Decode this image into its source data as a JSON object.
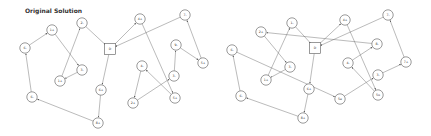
{
  "title": "Original Solution",
  "graphs": [
    {
      "name": "original-solution",
      "depot": {
        "id": "D",
        "x": 110,
        "y": 49
      },
      "nodes": [
        {
          "id": "a",
          "label": "1+",
          "x": 52,
          "y": 30
        },
        {
          "id": "b",
          "label": "6-",
          "x": 25,
          "y": 48
        },
        {
          "id": "c",
          "label": "2-",
          "x": 82,
          "y": 23
        },
        {
          "id": "d",
          "label": "3-",
          "x": 82,
          "y": 70
        },
        {
          "id": "e",
          "label": "1+",
          "x": 60,
          "y": 81
        },
        {
          "id": "f",
          "label": "4+",
          "x": 140,
          "y": 19
        },
        {
          "id": "g",
          "label": "7-",
          "x": 185,
          "y": 15
        },
        {
          "id": "h",
          "label": "9-",
          "x": 176,
          "y": 45
        },
        {
          "id": "i",
          "label": "5+",
          "x": 203,
          "y": 63
        },
        {
          "id": "j",
          "label": "4-",
          "x": 142,
          "y": 66
        },
        {
          "id": "k",
          "label": "3-",
          "x": 174,
          "y": 76
        },
        {
          "id": "l",
          "label": "2+",
          "x": 133,
          "y": 103
        },
        {
          "id": "m",
          "label": "5+",
          "x": 175,
          "y": 98
        },
        {
          "id": "n",
          "label": "6+",
          "x": 101,
          "y": 90
        },
        {
          "id": "o",
          "label": "8+",
          "x": 98,
          "y": 123
        },
        {
          "id": "p",
          "label": "6-",
          "x": 32,
          "y": 97
        }
      ],
      "edges": [
        [
          "b",
          "a"
        ],
        [
          "a",
          "d"
        ],
        [
          "d",
          "e"
        ],
        [
          "e",
          "c"
        ],
        [
          "c",
          "D"
        ],
        [
          "D",
          "f"
        ],
        [
          "f",
          "m"
        ],
        [
          "m",
          "j"
        ],
        [
          "j",
          "l"
        ],
        [
          "l",
          "k"
        ],
        [
          "k",
          "h"
        ],
        [
          "h",
          "i"
        ],
        [
          "i",
          "g"
        ],
        [
          "g",
          "D"
        ],
        [
          "D",
          "n"
        ],
        [
          "n",
          "o"
        ],
        [
          "o",
          "p"
        ],
        [
          "p",
          "b"
        ]
      ]
    },
    {
      "name": "modified-solution",
      "depot": {
        "id": "D",
        "x": 315,
        "y": 48
      },
      "nodes": [
        {
          "id": "a",
          "label": "2+",
          "x": 261,
          "y": 32
        },
        {
          "id": "b",
          "label": "1-",
          "x": 292,
          "y": 23
        },
        {
          "id": "c",
          "label": "4+",
          "x": 345,
          "y": 20
        },
        {
          "id": "d",
          "label": "7-",
          "x": 388,
          "y": 15
        },
        {
          "id": "e",
          "label": "8-",
          "x": 377,
          "y": 44
        },
        {
          "id": "f",
          "label": "6-",
          "x": 232,
          "y": 50
        },
        {
          "id": "g",
          "label": "3-",
          "x": 290,
          "y": 67
        },
        {
          "id": "h",
          "label": "1+",
          "x": 266,
          "y": 80
        },
        {
          "id": "i",
          "label": "4-",
          "x": 348,
          "y": 63
        },
        {
          "id": "j",
          "label": "7+",
          "x": 406,
          "y": 62
        },
        {
          "id": "k",
          "label": "3-",
          "x": 378,
          "y": 75
        },
        {
          "id": "l",
          "label": "6+",
          "x": 309,
          "y": 89
        },
        {
          "id": "m",
          "label": "5e",
          "x": 340,
          "y": 99
        },
        {
          "id": "n",
          "label": "5u",
          "x": 378,
          "y": 95
        },
        {
          "id": "o",
          "label": "6-",
          "x": 241,
          "y": 96
        },
        {
          "id": "p",
          "label": "8+",
          "x": 303,
          "y": 118
        }
      ],
      "edges": [
        [
          "e",
          "a"
        ],
        [
          "a",
          "g"
        ],
        [
          "g",
          "h"
        ],
        [
          "h",
          "b"
        ],
        [
          "b",
          "D"
        ],
        [
          "D",
          "c"
        ],
        [
          "c",
          "n"
        ],
        [
          "n",
          "i"
        ],
        [
          "i",
          "e"
        ],
        [
          "D",
          "l"
        ],
        [
          "l",
          "p"
        ],
        [
          "p",
          "o"
        ],
        [
          "o",
          "f"
        ],
        [
          "f",
          "m"
        ],
        [
          "m",
          "k"
        ],
        [
          "k",
          "j"
        ],
        [
          "j",
          "d"
        ],
        [
          "d",
          "D"
        ]
      ]
    }
  ]
}
